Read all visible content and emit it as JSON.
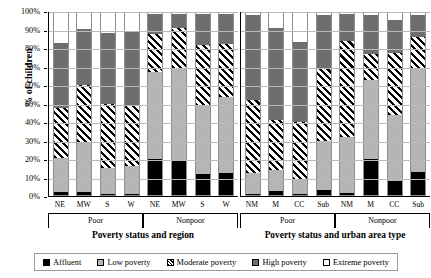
{
  "chart_data": {
    "type": "bar",
    "subtype": "stacked-100-percent",
    "title": "",
    "ylabel": "% of children",
    "ylim": [
      0,
      100
    ],
    "ytick_labels": [
      "0%",
      "10%",
      "20%",
      "30%",
      "40%",
      "50%",
      "60%",
      "70%",
      "80%",
      "90%",
      "100%"
    ],
    "ytick_values": [
      0,
      10,
      20,
      30,
      40,
      50,
      60,
      70,
      80,
      90,
      100
    ],
    "grid": true,
    "legend_position": "bottom",
    "series": [
      {
        "name": "Affluent",
        "key": "s0",
        "color": "#000000",
        "pattern": "solid-black"
      },
      {
        "name": "Low poverty",
        "key": "s1",
        "color": "#b5b5b5",
        "pattern": "solid-light-gray"
      },
      {
        "name": "Moderate poverty",
        "key": "s2",
        "color": "#ffffff",
        "pattern": "diagonal-hatch"
      },
      {
        "name": "High poverty",
        "key": "s3",
        "color": "#6e6e6e",
        "pattern": "solid-dark-gray"
      },
      {
        "name": "Extreme poverty",
        "key": "s4",
        "color": "#ffffff",
        "pattern": "empty-white"
      }
    ],
    "panels": [
      {
        "axis_title": "Poverty status and region",
        "groups": [
          {
            "label": "Poor",
            "categories": [
              "NE",
              "MW",
              "S",
              "W"
            ]
          },
          {
            "label": "Nonpoor",
            "categories": [
              "NE",
              "MW",
              "S",
              "W"
            ]
          }
        ],
        "bars": [
          {
            "group": "Poor",
            "category": "NE",
            "values": [
              1.5,
              19.0,
              27.5,
              35.5,
              16.5
            ]
          },
          {
            "group": "Poor",
            "category": "MW",
            "values": [
              1.5,
              27.5,
              31.5,
              31.0,
              8.5
            ]
          },
          {
            "group": "Poor",
            "category": "S",
            "values": [
              0.8,
              14.2,
              35.0,
              39.0,
              11.0
            ]
          },
          {
            "group": "Poor",
            "category": "W",
            "values": [
              0.8,
              15.2,
              33.5,
              40.5,
              10.0
            ]
          },
          {
            "group": "Nonpoor",
            "category": "NE",
            "values": [
              20.0,
              47.5,
              21.0,
              11.0,
              0.5
            ]
          },
          {
            "group": "Nonpoor",
            "category": "MW",
            "values": [
              19.5,
              50.5,
              21.5,
              8.0,
              0.5
            ]
          },
          {
            "group": "Nonpoor",
            "category": "S",
            "values": [
              11.5,
              37.5,
              33.5,
              17.0,
              0.5
            ]
          },
          {
            "group": "Nonpoor",
            "category": "W",
            "values": [
              12.0,
              42.0,
              29.0,
              16.5,
              0.5
            ]
          }
        ]
      },
      {
        "axis_title": "Poverty status and urban area type",
        "groups": [
          {
            "label": "Poor",
            "categories": [
              "NM",
              "M",
              "CC",
              "Sub"
            ]
          },
          {
            "label": "Nonpoor",
            "categories": [
              "NM",
              "M",
              "CC",
              "Sub"
            ]
          }
        ],
        "bars": [
          {
            "group": "Poor",
            "category": "NM",
            "values": [
              0.5,
              11.5,
              40.0,
              47.0,
              1.0
            ]
          },
          {
            "group": "Poor",
            "category": "M",
            "values": [
              2.0,
              12.0,
              27.5,
              50.5,
              8.0
            ]
          },
          {
            "group": "Poor",
            "category": "CC",
            "values": [
              0.5,
              7.5,
              32.0,
              44.0,
              16.0
            ]
          },
          {
            "group": "Poor",
            "category": "Sub",
            "values": [
              2.5,
              27.0,
              39.5,
              30.0,
              1.0
            ]
          },
          {
            "group": "Nonpoor",
            "category": "NM",
            "values": [
              1.0,
              31.0,
              52.5,
              15.0,
              0.5
            ]
          },
          {
            "group": "Nonpoor",
            "category": "M",
            "values": [
              20.0,
              43.0,
              14.5,
              21.5,
              1.0
            ]
          },
          {
            "group": "Nonpoor",
            "category": "CC",
            "values": [
              7.5,
              36.5,
              34.0,
              18.0,
              4.0
            ]
          },
          {
            "group": "Nonpoor",
            "category": "Sub",
            "values": [
              12.5,
              57.0,
              17.5,
              12.0,
              1.0
            ]
          }
        ]
      }
    ]
  },
  "legend": {
    "items": [
      {
        "label": "Affluent"
      },
      {
        "label": "Low poverty"
      },
      {
        "label": "Moderate poverty"
      },
      {
        "label": "High poverty"
      },
      {
        "label": "Extreme poverty"
      }
    ]
  }
}
